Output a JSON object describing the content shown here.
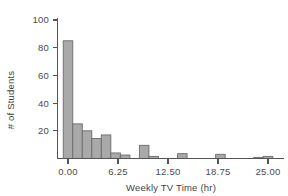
{
  "chart_data": {
    "type": "bar",
    "title": "",
    "subtitle": "",
    "xlabel": "Weekly TV Time (hr)",
    "ylabel": "# of Students",
    "xlim": [
      -1.5,
      26.5
    ],
    "ylim": [
      0,
      105
    ],
    "grid": false,
    "legend": null,
    "bin_width": 1.19,
    "xticks": [
      "0.00",
      "6.25",
      "12.50",
      "18.75",
      "25.00"
    ],
    "xtick_values": [
      0,
      6.25,
      12.5,
      18.75,
      25
    ],
    "yticks": [
      "20",
      "40",
      "60",
      "80",
      "100"
    ],
    "ytick_values": [
      20,
      40,
      60,
      80,
      100
    ],
    "bars": [
      {
        "x": 0.0,
        "value": 85
      },
      {
        "x": 1.19,
        "value": 25
      },
      {
        "x": 2.38,
        "value": 20
      },
      {
        "x": 3.57,
        "value": 14.5
      },
      {
        "x": 4.76,
        "value": 17
      },
      {
        "x": 5.95,
        "value": 4
      },
      {
        "x": 7.14,
        "value": 2.5
      },
      {
        "x": 9.52,
        "value": 9.5
      },
      {
        "x": 10.71,
        "value": 1.5
      },
      {
        "x": 14.29,
        "value": 3.5
      },
      {
        "x": 19.05,
        "value": 3
      },
      {
        "x": 23.81,
        "value": 0.8
      },
      {
        "x": 25.0,
        "value": 1.5
      }
    ],
    "categories": [
      "0.00",
      "1.19",
      "2.38",
      "3.57",
      "4.76",
      "5.95",
      "7.14",
      "9.52",
      "10.71",
      "14.29",
      "19.05",
      "23.81",
      "25.00"
    ],
    "values": [
      85,
      25,
      20,
      14.5,
      17,
      4,
      2.5,
      9.5,
      1.5,
      3.5,
      3,
      0.8,
      1.5
    ],
    "colors": {
      "bar_fill": "#a9a9a9",
      "bar_stroke": "#6b6b6b",
      "axis": "#555555",
      "text": "#3f3f3f",
      "background": "#ffffff"
    }
  }
}
